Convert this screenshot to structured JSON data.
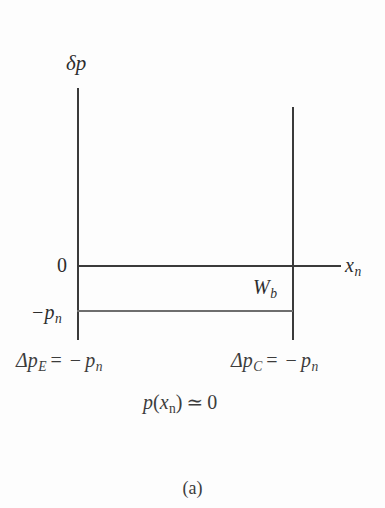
{
  "figure": {
    "caption": "(a)",
    "background_color": "#fdfdfd",
    "line_color": "#3a3a3a",
    "secondary_line_color": "#6e6e6e",
    "text_color": "#2d2d2d"
  },
  "axes": {
    "y_axis_label": "δp",
    "x_axis_label_base": "x",
    "x_axis_label_sub": "n",
    "origin_label": "0",
    "lower_level_label_base": "−p",
    "lower_level_label_sub": "n",
    "width_label_base": "W",
    "width_label_sub": "b"
  },
  "equations": {
    "emitter": {
      "lhs_base": "Δp",
      "lhs_sub": "E",
      "equals": "=",
      "minus": "−",
      "rhs_base": "p",
      "rhs_sub": "n"
    },
    "collector": {
      "lhs_base": "Δp",
      "lhs_sub": "C",
      "equals": "=",
      "minus": "−",
      "rhs_base": "p",
      "rhs_sub": "n"
    },
    "boundary": {
      "func": "p",
      "open": "(",
      "arg_base": "x",
      "arg_sub": "n",
      "close": ")",
      "relation": "≃",
      "value": "0"
    }
  },
  "chart_data": {
    "type": "line",
    "title": "(a)",
    "xlabel": "x_n",
    "ylabel": "δp",
    "xlim": [
      0,
      1.24
    ],
    "ylim": [
      -1.35,
      2.65
    ],
    "grid": false,
    "legend": null,
    "annotations": [
      {
        "text": "W_b",
        "x": 0.88,
        "y": -0.35
      },
      {
        "text": "Δp_E = − p_n",
        "x": 0.0,
        "y": -2.0
      },
      {
        "text": "Δp_C = − p_n",
        "x": 1.0,
        "y": -2.0
      },
      {
        "text": "p(x_n) ≃ 0",
        "x": 0.5,
        "y": -2.7
      }
    ],
    "reference_lines": [
      {
        "name": "zero-level",
        "orientation": "horizontal",
        "y": 0,
        "x_from": 0.0,
        "x_to": 1.24,
        "color": "#3a3a3a"
      },
      {
        "name": "minus-pn-level",
        "orientation": "horizontal",
        "y": -1.0,
        "x_from": 0.0,
        "x_to": 1.0,
        "color": "#6e6e6e"
      },
      {
        "name": "emitter-edge",
        "orientation": "vertical",
        "x": 0.0,
        "y_from": -1.65,
        "y_to": 2.6,
        "color": "#3a3a3a"
      },
      {
        "name": "collector-edge",
        "orientation": "vertical",
        "x": 1.0,
        "y_from": -1.65,
        "y_to": 2.2,
        "color": "#3a3a3a"
      }
    ],
    "tick_labels": {
      "y": [
        {
          "value": 0,
          "label": "0"
        },
        {
          "value": -1.0,
          "label": "−p_n"
        }
      ],
      "x": []
    },
    "series": [
      {
        "name": "excess hole concentration δp",
        "x": [
          0.0,
          1.0
        ],
        "values": [
          -1.0,
          -1.0
        ]
      }
    ]
  }
}
